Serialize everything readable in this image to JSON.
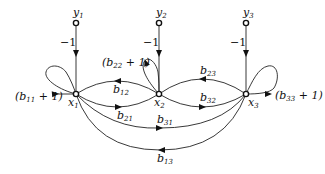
{
  "diagram": {
    "type": "signal-flow-graph",
    "nodes": [
      {
        "id": "y1",
        "label": "y",
        "sub": "1",
        "x": 76,
        "y": 23
      },
      {
        "id": "y2",
        "label": "y",
        "sub": "2",
        "x": 159,
        "y": 23
      },
      {
        "id": "y3",
        "label": "y",
        "sub": "3",
        "x": 246,
        "y": 23
      },
      {
        "id": "x1",
        "label": "x",
        "sub": "1",
        "x": 76,
        "y": 94
      },
      {
        "id": "x2",
        "label": "x",
        "sub": "2",
        "x": 159,
        "y": 94
      },
      {
        "id": "x3",
        "label": "x",
        "sub": "3",
        "x": 246,
        "y": 94
      }
    ],
    "edges": [
      {
        "from": "y1",
        "to": "x1",
        "gain": "−1"
      },
      {
        "from": "y2",
        "to": "x2",
        "gain": "−1"
      },
      {
        "from": "y3",
        "to": "x3",
        "gain": "−1"
      },
      {
        "from": "x1",
        "to": "x1",
        "gain_base": "(b",
        "gain_sub": "11",
        "gain_tail": " + 1)"
      },
      {
        "from": "x2",
        "to": "x2",
        "gain_base": "(b",
        "gain_sub": "22",
        "gain_tail": " + 1)"
      },
      {
        "from": "x3",
        "to": "x3",
        "gain_base": "(b",
        "gain_sub": "33",
        "gain_tail": " + 1)"
      },
      {
        "from": "x2",
        "to": "x1",
        "gain_base": "b",
        "gain_sub": "12"
      },
      {
        "from": "x1",
        "to": "x2",
        "gain_base": "b",
        "gain_sub": "21"
      },
      {
        "from": "x3",
        "to": "x2",
        "gain_base": "b",
        "gain_sub": "23"
      },
      {
        "from": "x2",
        "to": "x3",
        "gain_base": "b",
        "gain_sub": "32"
      },
      {
        "from": "x1",
        "to": "x3",
        "gain_base": "b",
        "gain_sub": "31"
      },
      {
        "from": "x3",
        "to": "x1",
        "gain_base": "b",
        "gain_sub": "13"
      }
    ]
  },
  "labels": {
    "y1": {
      "base": "y",
      "sub": "1"
    },
    "y2": {
      "base": "y",
      "sub": "2"
    },
    "y3": {
      "base": "y",
      "sub": "3"
    },
    "x1": {
      "base": "x",
      "sub": "1"
    },
    "x2": {
      "base": "x",
      "sub": "2"
    },
    "x3": {
      "base": "x",
      "sub": "3"
    },
    "minus_one": "−1",
    "b11": {
      "open": "(b",
      "sub": "11",
      "close": " + 1)"
    },
    "b22": {
      "open": "(b",
      "sub": "22",
      "close": " + 1)"
    },
    "b33": {
      "open": "(b",
      "sub": "33",
      "close": " + 1)"
    },
    "b12": {
      "base": "b",
      "sub": "12"
    },
    "b21": {
      "base": "b",
      "sub": "21"
    },
    "b23": {
      "base": "b",
      "sub": "23"
    },
    "b32": {
      "base": "b",
      "sub": "32"
    },
    "b31": {
      "base": "b",
      "sub": "31"
    },
    "b13": {
      "base": "b",
      "sub": "13"
    }
  }
}
